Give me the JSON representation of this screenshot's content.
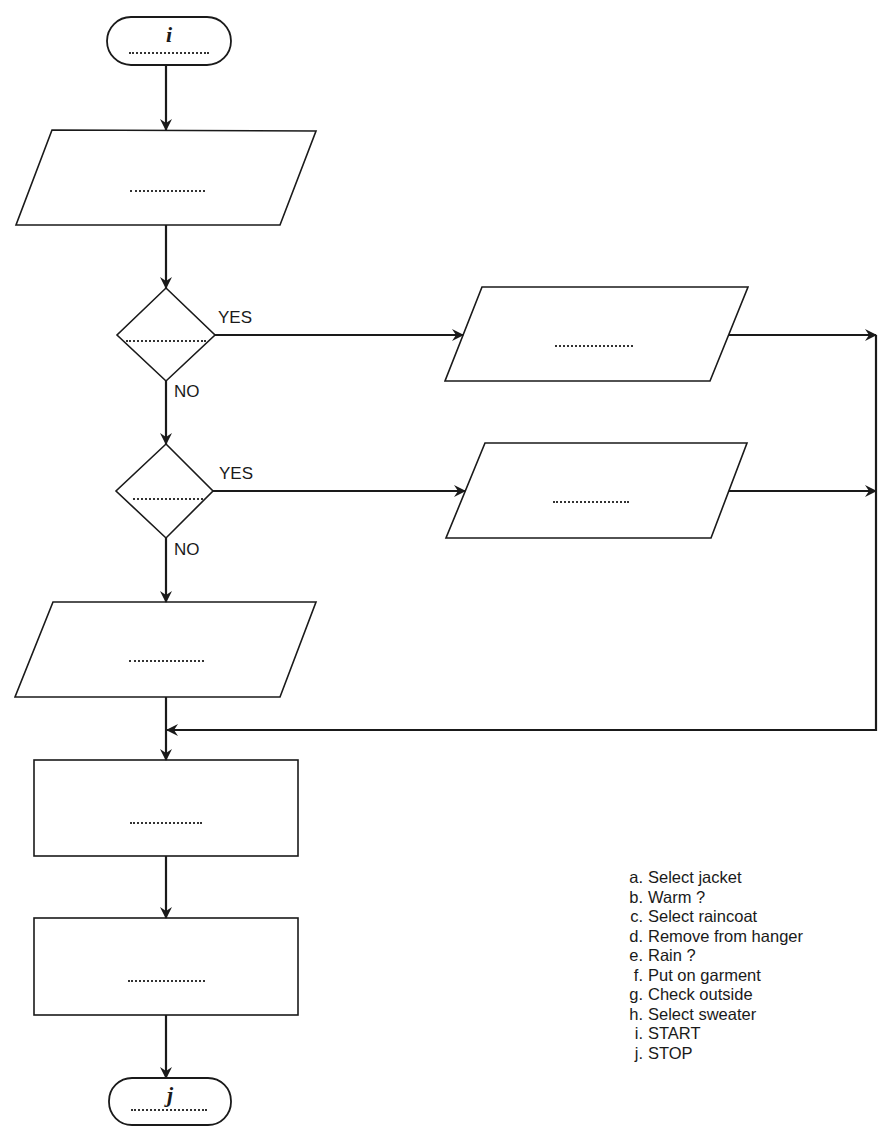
{
  "diagram": {
    "terminals": [
      {
        "id": "start",
        "label": "i"
      },
      {
        "id": "stop",
        "label": "j"
      }
    ],
    "branch_labels": {
      "decision1_yes": "YES",
      "decision1_no": "NO",
      "decision2_yes": "YES",
      "decision2_no": "NO"
    },
    "blank_placeholder": "...............",
    "legend": [
      {
        "key": "a.",
        "text": "Select jacket"
      },
      {
        "key": "b.",
        "text": "Warm ?"
      },
      {
        "key": "c.",
        "text": "Select raincoat"
      },
      {
        "key": "d.",
        "text": "Remove from hanger"
      },
      {
        "key": "e.",
        "text": "Rain ?"
      },
      {
        "key": "f.",
        "text": "Put on garment"
      },
      {
        "key": "g.",
        "text": "Check outside"
      },
      {
        "key": "h.",
        "text": "Select sweater"
      },
      {
        "key": "i.",
        "text": "START"
      },
      {
        "key": "j.",
        "text": "STOP"
      }
    ],
    "stroke_color": "#1a1a1a"
  }
}
